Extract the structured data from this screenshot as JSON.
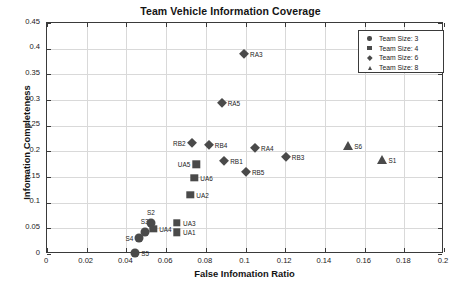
{
  "chart_data": {
    "type": "scatter",
    "title": "Team Vehicle Information Coverage",
    "xlabel": "False Infomation Ratio",
    "ylabel": "Infomation Completeness",
    "xlim": [
      0,
      0.2
    ],
    "ylim": [
      0,
      0.45
    ],
    "xticks": [
      "0",
      "0.02",
      "0.04",
      "0.06",
      "0.08",
      "0.1",
      "0.12",
      "0.14",
      "0.16",
      "0.18",
      "0.2"
    ],
    "xtick_values": [
      0,
      0.02,
      0.04,
      0.06,
      0.08,
      0.1,
      0.12,
      0.14,
      0.16,
      0.18,
      0.2
    ],
    "yticks": [
      "0",
      "0.05",
      "0.1",
      "0.15",
      "0.2",
      "0.25",
      "0.3",
      "0.35",
      "0.4",
      "0.45"
    ],
    "ytick_values": [
      0,
      0.05,
      0.1,
      0.15,
      0.2,
      0.25,
      0.3,
      0.35,
      0.4,
      0.45
    ],
    "grid": true,
    "legend_position": "top-right",
    "marker_color": "#4a4a4a",
    "series": [
      {
        "name": "Team Size: 3",
        "marker": "circle",
        "points": [
          {
            "label": "S5",
            "x": 0.0445,
            "y": 0.002,
            "label_pos": "r"
          },
          {
            "label": "S4",
            "x": 0.0465,
            "y": 0.032,
            "label_pos": "l"
          },
          {
            "label": "S3",
            "x": 0.0492,
            "y": 0.043,
            "label_pos": "t"
          },
          {
            "label": "S2",
            "x": 0.0523,
            "y": 0.06,
            "label_pos": "t"
          }
        ]
      },
      {
        "name": "Team Size: 4",
        "marker": "square",
        "points": [
          {
            "label": "UA4",
            "x": 0.0535,
            "y": 0.049,
            "label_pos": "r"
          },
          {
            "label": "UA1",
            "x": 0.0655,
            "y": 0.042,
            "label_pos": "r"
          },
          {
            "label": "UA3",
            "x": 0.0655,
            "y": 0.061,
            "label_pos": "r"
          },
          {
            "label": "UA2",
            "x": 0.0722,
            "y": 0.115,
            "label_pos": "r"
          },
          {
            "label": "UA6",
            "x": 0.0742,
            "y": 0.149,
            "label_pos": "r"
          },
          {
            "label": "UA5",
            "x": 0.0752,
            "y": 0.175,
            "label_pos": "l"
          }
        ]
      },
      {
        "name": "Team Size: 6",
        "marker": "diamond",
        "points": [
          {
            "label": "RB2",
            "x": 0.0728,
            "y": 0.217,
            "label_pos": "l"
          },
          {
            "label": "RB4",
            "x": 0.0815,
            "y": 0.213,
            "label_pos": "r"
          },
          {
            "label": "RA5",
            "x": 0.088,
            "y": 0.295,
            "label_pos": "r"
          },
          {
            "label": "RB1",
            "x": 0.0893,
            "y": 0.181,
            "label_pos": "r"
          },
          {
            "label": "RA3",
            "x": 0.0993,
            "y": 0.389,
            "label_pos": "r"
          },
          {
            "label": "RB5",
            "x": 0.1002,
            "y": 0.16,
            "label_pos": "r"
          },
          {
            "label": "RA4",
            "x": 0.1048,
            "y": 0.207,
            "label_pos": "r"
          },
          {
            "label": "RB3",
            "x": 0.1203,
            "y": 0.189,
            "label_pos": "r"
          }
        ]
      },
      {
        "name": "Team Size: 8",
        "marker": "triangle",
        "points": [
          {
            "label": "S6",
            "x": 0.1518,
            "y": 0.21,
            "label_pos": "r"
          },
          {
            "label": "S1",
            "x": 0.169,
            "y": 0.183,
            "label_pos": "r"
          }
        ]
      }
    ]
  }
}
